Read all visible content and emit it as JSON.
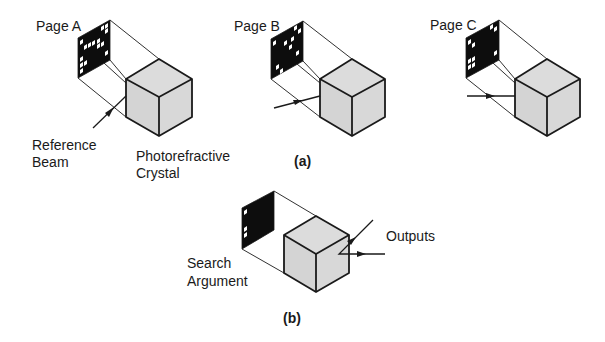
{
  "figure": {
    "panel_a": {
      "label": "(a)",
      "pages": [
        {
          "id": "A",
          "title": "Page A"
        },
        {
          "id": "B",
          "title": "Page B"
        },
        {
          "id": "C",
          "title": "Page C"
        }
      ],
      "reference_beam_label": [
        "Reference",
        "Beam"
      ],
      "crystal_label": [
        "Photorefractive",
        "Crystal"
      ]
    },
    "panel_b": {
      "label": "(b)",
      "search_argument_label": [
        "Search",
        "Argument"
      ],
      "outputs_label": "Outputs"
    }
  },
  "colors": {
    "ink": "#1a1a1a",
    "crystal_fill": "#d8d8d8",
    "page_fill": "#0d0d0d",
    "background": "#ffffff"
  }
}
